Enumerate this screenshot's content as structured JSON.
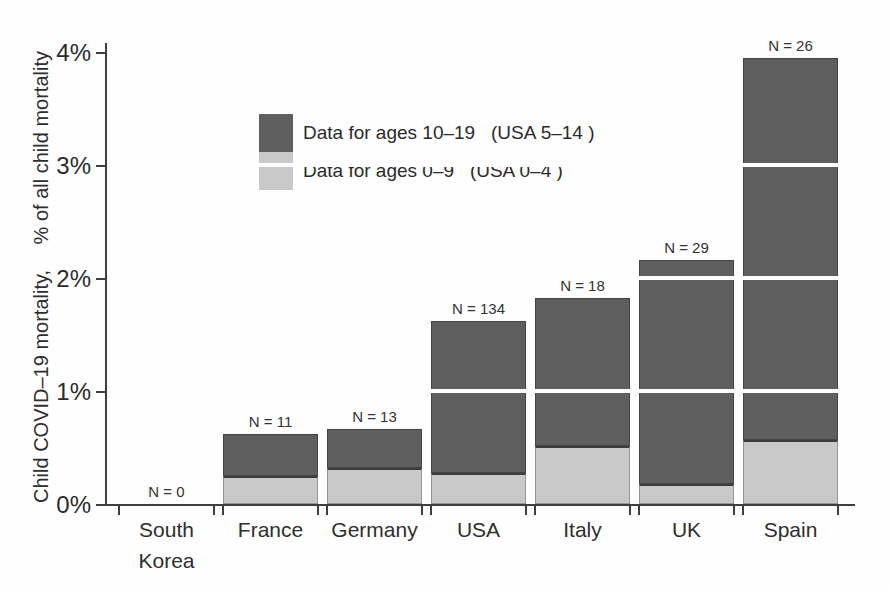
{
  "colors": {
    "dark_series": "#5f5f5f",
    "light_series": "#c9c9c9",
    "axis": "#3f3f3f",
    "gridline": "#ffffff",
    "text": "#2b2b2b"
  },
  "y_axis": {
    "label_part1": "Child COVID–19 mortality,",
    "label_part2": "% of all child mortality",
    "ticks": [
      {
        "value": 0,
        "label": "0%"
      },
      {
        "value": 1,
        "label": "1%"
      },
      {
        "value": 2,
        "label": "2%"
      },
      {
        "value": 3,
        "label": "3%"
      },
      {
        "value": 4,
        "label": "4%"
      }
    ]
  },
  "legend": {
    "items": [
      {
        "label": "Data for ages 10–19   (USA 5–14 )",
        "color_key": "dark_series"
      },
      {
        "label": "Data for ages 0–9   (USA 0–4 )",
        "color_key": "light_series"
      }
    ]
  },
  "chart_data": {
    "type": "bar",
    "stacked": true,
    "title": "",
    "xlabel": "",
    "ylabel": "Child COVID–19 mortality, % of all child mortality",
    "y_unit": "%",
    "ylim": [
      0,
      4
    ],
    "grid": "white lines over bars",
    "gridlines_at": [
      1,
      2,
      3
    ],
    "legend_position": "upper-left-inside",
    "categories": [
      "South Korea",
      "France",
      "Germany",
      "USA",
      "Italy",
      "UK",
      "Spain"
    ],
    "category_label_lines": [
      [
        "South",
        "Korea"
      ],
      [
        "France"
      ],
      [
        "Germany"
      ],
      [
        "USA"
      ],
      [
        "Italy"
      ],
      [
        "UK"
      ],
      [
        "Spain"
      ]
    ],
    "n_labels": [
      "N = 0",
      "N = 11",
      "N = 13",
      "N = 134",
      "N = 18",
      "N = 29",
      "N = 26"
    ],
    "n_values": [
      0,
      11,
      13,
      134,
      18,
      29,
      26
    ],
    "series": [
      {
        "name": "Data for ages 0–9 (USA 0–4)",
        "role": "light",
        "values": [
          0,
          0.25,
          0.32,
          0.27,
          0.51,
          0.18,
          0.57
        ]
      },
      {
        "name": "Data for ages 10–19 (USA 5–14)",
        "role": "dark",
        "values": [
          0,
          0.37,
          0.34,
          1.35,
          1.31,
          1.98,
          3.38
        ]
      }
    ],
    "totals": [
      0,
      0.62,
      0.66,
      1.62,
      1.82,
      2.16,
      3.95
    ]
  }
}
